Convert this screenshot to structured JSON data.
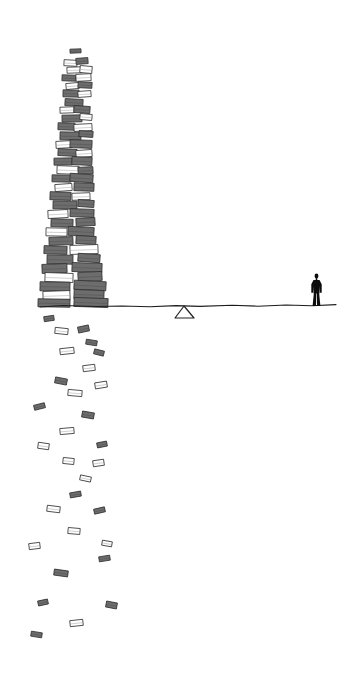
{
  "artwork": {
    "title": "Tower of falling books",
    "medium": "pencil and ink line drawing",
    "background_color": "#ffffff",
    "canvas": {
      "width": 352,
      "height": 677
    }
  },
  "palette": {
    "background": "#ffffff",
    "book_fill": "#6d6d6d",
    "book_outline": "#2e2e2e",
    "book_hollow_fill": "#ffffff",
    "ground_line": "#1d1d1d",
    "fulcrum_line": "#242424",
    "figure_silhouette": "#0d0d0d"
  },
  "ground": {
    "label": "horizon line",
    "path": "M 40 307 L 63 305.5 L 96 306.5 L 122 306 L 150 306.8 L 176 305.6 L 200 306.4 L 232 305.2 L 258 306.2 L 286 305.0 L 312 305.8 L 336 304.6",
    "x_start": 40,
    "x_end": 336,
    "y_approx": 306
  },
  "fulcrum": {
    "label": "triangular pivot under the line",
    "apex": {
      "x": 184,
      "y": 306
    },
    "left_foot": {
      "x": 175,
      "y": 318
    },
    "right_foot": {
      "x": 194,
      "y": 318
    }
  },
  "figure": {
    "label": "standing person silhouette",
    "x": 310,
    "y": 273,
    "width": 13,
    "height": 33,
    "stance": "legs apart, arms at sides, facing viewer"
  },
  "tower": {
    "label": "tall leaning stack of books",
    "top_y": 49,
    "base_y": 307,
    "top_x_range": [
      62,
      96
    ],
    "base_x_range": [
      38,
      118
    ],
    "description": "narrow at the top, widening and densest toward the base"
  },
  "falling_books": {
    "label": "books scattering below the horizon",
    "count": 46,
    "y_range": [
      316,
      632
    ],
    "x_range": [
      20,
      118
    ],
    "description": "loose open-book shapes drifting downward in a widening column"
  },
  "stack_books": [
    {
      "x": 70,
      "y": 49,
      "w": 11,
      "h": 4,
      "r": -2,
      "fill": "solid"
    },
    {
      "x": 64,
      "y": 60,
      "w": 13,
      "h": 6,
      "r": 3,
      "fill": "hollow"
    },
    {
      "x": 76,
      "y": 58,
      "w": 12,
      "h": 6,
      "r": -4,
      "fill": "solid"
    },
    {
      "x": 67,
      "y": 67,
      "w": 15,
      "h": 6,
      "r": -2,
      "fill": "hollow"
    },
    {
      "x": 80,
      "y": 66,
      "w": 12,
      "h": 7,
      "r": 5,
      "fill": "hollow"
    },
    {
      "x": 62,
      "y": 75,
      "w": 14,
      "h": 6,
      "r": 2,
      "fill": "solid"
    },
    {
      "x": 76,
      "y": 74,
      "w": 15,
      "h": 7,
      "r": -3,
      "fill": "hollow"
    },
    {
      "x": 66,
      "y": 83,
      "w": 13,
      "h": 6,
      "r": -5,
      "fill": "hollow"
    },
    {
      "x": 78,
      "y": 82,
      "w": 14,
      "h": 6,
      "r": 3,
      "fill": "solid"
    },
    {
      "x": 63,
      "y": 90,
      "w": 16,
      "h": 7,
      "r": 1,
      "fill": "solid"
    },
    {
      "x": 78,
      "y": 91,
      "w": 13,
      "h": 6,
      "r": -4,
      "fill": "hollow"
    },
    {
      "x": 65,
      "y": 99,
      "w": 18,
      "h": 7,
      "r": 3,
      "fill": "solid"
    },
    {
      "x": 60,
      "y": 107,
      "w": 14,
      "h": 6,
      "r": -2,
      "fill": "hollow"
    },
    {
      "x": 74,
      "y": 106,
      "w": 16,
      "h": 7,
      "r": 4,
      "fill": "solid"
    },
    {
      "x": 62,
      "y": 115,
      "w": 20,
      "h": 7,
      "r": -1,
      "fill": "solid"
    },
    {
      "x": 80,
      "y": 114,
      "w": 12,
      "h": 6,
      "r": 5,
      "fill": "hollow"
    },
    {
      "x": 58,
      "y": 123,
      "w": 17,
      "h": 7,
      "r": 2,
      "fill": "solid"
    },
    {
      "x": 74,
      "y": 124,
      "w": 18,
      "h": 7,
      "r": -3,
      "fill": "hollow"
    },
    {
      "x": 60,
      "y": 132,
      "w": 21,
      "h": 8,
      "r": 1,
      "fill": "solid"
    },
    {
      "x": 79,
      "y": 131,
      "w": 14,
      "h": 6,
      "r": 4,
      "fill": "solid"
    },
    {
      "x": 56,
      "y": 141,
      "w": 16,
      "h": 7,
      "r": -3,
      "fill": "hollow"
    },
    {
      "x": 70,
      "y": 140,
      "w": 22,
      "h": 8,
      "r": 2,
      "fill": "solid"
    },
    {
      "x": 58,
      "y": 149,
      "w": 19,
      "h": 7,
      "r": 3,
      "fill": "solid"
    },
    {
      "x": 76,
      "y": 150,
      "w": 16,
      "h": 7,
      "r": -4,
      "fill": "hollow"
    },
    {
      "x": 54,
      "y": 158,
      "w": 18,
      "h": 7,
      "r": -1,
      "fill": "solid"
    },
    {
      "x": 72,
      "y": 157,
      "w": 20,
      "h": 8,
      "r": 3,
      "fill": "solid"
    },
    {
      "x": 57,
      "y": 166,
      "w": 22,
      "h": 8,
      "r": 2,
      "fill": "hollow"
    },
    {
      "x": 78,
      "y": 167,
      "w": 15,
      "h": 7,
      "r": -3,
      "fill": "solid"
    },
    {
      "x": 52,
      "y": 175,
      "w": 19,
      "h": 7,
      "r": 1,
      "fill": "solid"
    },
    {
      "x": 70,
      "y": 174,
      "w": 23,
      "h": 8,
      "r": 4,
      "fill": "solid"
    },
    {
      "x": 55,
      "y": 184,
      "w": 17,
      "h": 7,
      "r": -4,
      "fill": "hollow"
    },
    {
      "x": 74,
      "y": 183,
      "w": 20,
      "h": 8,
      "r": 2,
      "fill": "solid"
    },
    {
      "x": 50,
      "y": 192,
      "w": 21,
      "h": 8,
      "r": 2,
      "fill": "solid"
    },
    {
      "x": 72,
      "y": 193,
      "w": 18,
      "h": 7,
      "r": -2,
      "fill": "hollow"
    },
    {
      "x": 53,
      "y": 201,
      "w": 24,
      "h": 8,
      "r": 1,
      "fill": "solid"
    },
    {
      "x": 78,
      "y": 200,
      "w": 16,
      "h": 7,
      "r": 4,
      "fill": "solid"
    },
    {
      "x": 48,
      "y": 210,
      "w": 20,
      "h": 8,
      "r": -3,
      "fill": "hollow"
    },
    {
      "x": 70,
      "y": 209,
      "w": 24,
      "h": 8,
      "r": 2,
      "fill": "solid"
    },
    {
      "x": 51,
      "y": 219,
      "w": 22,
      "h": 8,
      "r": 2,
      "fill": "solid"
    },
    {
      "x": 76,
      "y": 218,
      "w": 19,
      "h": 8,
      "r": -3,
      "fill": "solid"
    },
    {
      "x": 46,
      "y": 228,
      "w": 21,
      "h": 8,
      "r": 1,
      "fill": "hollow"
    },
    {
      "x": 68,
      "y": 227,
      "w": 26,
      "h": 9,
      "r": 3,
      "fill": "solid"
    },
    {
      "x": 49,
      "y": 237,
      "w": 24,
      "h": 8,
      "r": -2,
      "fill": "solid"
    },
    {
      "x": 76,
      "y": 236,
      "w": 20,
      "h": 8,
      "r": 3,
      "fill": "solid"
    },
    {
      "x": 44,
      "y": 246,
      "w": 23,
      "h": 8,
      "r": 2,
      "fill": "solid"
    },
    {
      "x": 70,
      "y": 245,
      "w": 28,
      "h": 9,
      "r": -2,
      "fill": "hollow"
    },
    {
      "x": 47,
      "y": 255,
      "w": 26,
      "h": 9,
      "r": 1,
      "fill": "solid"
    },
    {
      "x": 78,
      "y": 254,
      "w": 22,
      "h": 8,
      "r": 4,
      "fill": "solid"
    },
    {
      "x": 42,
      "y": 264,
      "w": 25,
      "h": 9,
      "r": -2,
      "fill": "solid"
    },
    {
      "x": 72,
      "y": 263,
      "w": 30,
      "h": 9,
      "r": 2,
      "fill": "solid"
    },
    {
      "x": 45,
      "y": 273,
      "w": 28,
      "h": 9,
      "r": 2,
      "fill": "hollow"
    },
    {
      "x": 78,
      "y": 272,
      "w": 24,
      "h": 9,
      "r": -3,
      "fill": "solid"
    },
    {
      "x": 40,
      "y": 282,
      "w": 30,
      "h": 9,
      "r": 1,
      "fill": "solid"
    },
    {
      "x": 74,
      "y": 281,
      "w": 32,
      "h": 9,
      "r": 3,
      "fill": "solid"
    },
    {
      "x": 43,
      "y": 291,
      "w": 27,
      "h": 9,
      "r": -2,
      "fill": "hollow"
    },
    {
      "x": 74,
      "y": 290,
      "w": 30,
      "h": 9,
      "r": 2,
      "fill": "solid"
    },
    {
      "x": 38,
      "y": 299,
      "w": 32,
      "h": 8,
      "r": 1,
      "fill": "solid"
    },
    {
      "x": 74,
      "y": 298,
      "w": 34,
      "h": 9,
      "r": 2,
      "fill": "solid"
    }
  ],
  "falling_book_items": [
    {
      "x": 44,
      "y": 316,
      "w": 10,
      "h": 5,
      "r": -8,
      "fill": "solid"
    },
    {
      "x": 55,
      "y": 328,
      "w": 13,
      "h": 6,
      "r": 6,
      "fill": "hollow"
    },
    {
      "x": 78,
      "y": 326,
      "w": 11,
      "h": 6,
      "r": -12,
      "fill": "solid"
    },
    {
      "x": 86,
      "y": 340,
      "w": 11,
      "h": 5,
      "r": 9,
      "fill": "solid"
    },
    {
      "x": 60,
      "y": 348,
      "w": 14,
      "h": 6,
      "r": -6,
      "fill": "hollow"
    },
    {
      "x": 94,
      "y": 350,
      "w": 10,
      "h": 5,
      "r": 14,
      "fill": "solid"
    },
    {
      "x": 83,
      "y": 365,
      "w": 12,
      "h": 6,
      "r": -7,
      "fill": "hollow"
    },
    {
      "x": 55,
      "y": 378,
      "w": 12,
      "h": 6,
      "r": 11,
      "fill": "solid"
    },
    {
      "x": 95,
      "y": 382,
      "w": 12,
      "h": 6,
      "r": -9,
      "fill": "hollow"
    },
    {
      "x": 68,
      "y": 390,
      "w": 14,
      "h": 6,
      "r": 5,
      "fill": "hollow"
    },
    {
      "x": 34,
      "y": 404,
      "w": 11,
      "h": 5,
      "r": -14,
      "fill": "solid"
    },
    {
      "x": 82,
      "y": 412,
      "w": 12,
      "h": 6,
      "r": 10,
      "fill": "solid"
    },
    {
      "x": 60,
      "y": 428,
      "w": 14,
      "h": 6,
      "r": -5,
      "fill": "hollow"
    },
    {
      "x": 38,
      "y": 443,
      "w": 11,
      "h": 6,
      "r": 8,
      "fill": "hollow"
    },
    {
      "x": 97,
      "y": 442,
      "w": 10,
      "h": 5,
      "r": -11,
      "fill": "solid"
    },
    {
      "x": 63,
      "y": 458,
      "w": 11,
      "h": 6,
      "r": 6,
      "fill": "hollow"
    },
    {
      "x": 93,
      "y": 460,
      "w": 11,
      "h": 6,
      "r": -8,
      "fill": "hollow"
    },
    {
      "x": 80,
      "y": 476,
      "w": 11,
      "h": 5,
      "r": 12,
      "fill": "hollow"
    },
    {
      "x": 70,
      "y": 492,
      "w": 11,
      "h": 5,
      "r": -10,
      "fill": "solid"
    },
    {
      "x": 47,
      "y": 506,
      "w": 13,
      "h": 6,
      "r": 7,
      "fill": "hollow"
    },
    {
      "x": 94,
      "y": 508,
      "w": 11,
      "h": 5,
      "r": -13,
      "fill": "solid"
    },
    {
      "x": 68,
      "y": 528,
      "w": 12,
      "h": 6,
      "r": 5,
      "fill": "hollow"
    },
    {
      "x": 29,
      "y": 543,
      "w": 11,
      "h": 6,
      "r": -7,
      "fill": "hollow"
    },
    {
      "x": 102,
      "y": 541,
      "w": 10,
      "h": 5,
      "r": 10,
      "fill": "hollow"
    },
    {
      "x": 99,
      "y": 556,
      "w": 11,
      "h": 5,
      "r": -9,
      "fill": "solid"
    },
    {
      "x": 54,
      "y": 570,
      "w": 14,
      "h": 6,
      "r": 8,
      "fill": "solid"
    },
    {
      "x": 38,
      "y": 600,
      "w": 10,
      "h": 5,
      "r": -12,
      "fill": "solid"
    },
    {
      "x": 106,
      "y": 602,
      "w": 11,
      "h": 6,
      "r": 11,
      "fill": "solid"
    },
    {
      "x": 70,
      "y": 620,
      "w": 13,
      "h": 6,
      "r": -6,
      "fill": "hollow"
    },
    {
      "x": 31,
      "y": 632,
      "w": 11,
      "h": 5,
      "r": 9,
      "fill": "solid"
    }
  ]
}
